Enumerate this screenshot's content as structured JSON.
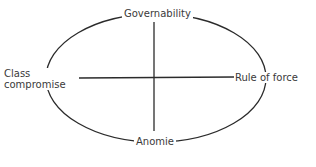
{
  "diagram": {
    "type": "quadrant-ellipse",
    "poles": {
      "top": "Governability",
      "bottom": "Anomie",
      "left_line1": "Class",
      "left_line2": "compromise",
      "right": "Rule of force"
    },
    "colors": {
      "stroke": "#2b2b2b",
      "text": "#3a3a3a",
      "background": "#ffffff"
    }
  }
}
